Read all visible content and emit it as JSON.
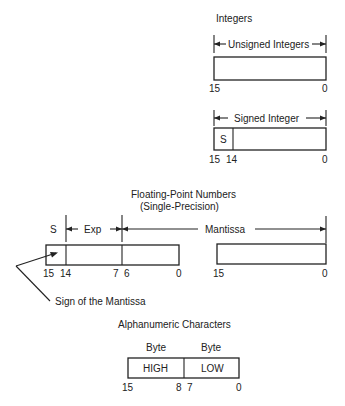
{
  "sections": {
    "integers": {
      "title": "Integers",
      "unsigned": {
        "label": "Unsigned Integers",
        "bit_high": "15",
        "bit_low": "0"
      },
      "signed": {
        "label": "Signed Integer",
        "sign_field": "S",
        "bit_high": "15",
        "bit_sign_next": "14",
        "bit_low": "0"
      }
    },
    "floating_point": {
      "title": "Floating-Point Numbers",
      "subtitle": "(Single-Precision)",
      "sign_label": "S",
      "exp_label": "Exp",
      "mantissa_label": "Mantissa",
      "word1_bits": [
        "15",
        "14",
        "7",
        "6",
        "0"
      ],
      "word2_bits": [
        "15",
        "0"
      ],
      "sign_callout": "Sign of the Mantissa"
    },
    "alphanumeric": {
      "title": "Alphanumeric Characters",
      "byte_high_label": "Byte",
      "byte_low_label": "Byte",
      "high_field": "HIGH",
      "low_field": "LOW",
      "bits": [
        "15",
        "8",
        "7",
        "0"
      ]
    }
  }
}
